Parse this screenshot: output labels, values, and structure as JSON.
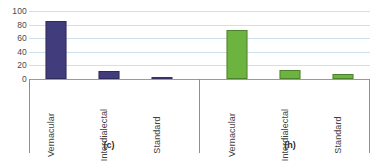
{
  "chart_data": {
    "type": "bar",
    "title": "",
    "subtitle": "",
    "xlabel": "",
    "ylabel": "",
    "ylim": [
      0,
      100
    ],
    "yticks": [
      0,
      20,
      40,
      60,
      80,
      100
    ],
    "ytick_labels": [
      "0",
      "20",
      "40",
      "60",
      "80",
      "100"
    ],
    "grid": true,
    "legend": "none",
    "categories": [
      "Vernacular",
      "Interdialectal",
      "Standard"
    ],
    "panels": [
      {
        "caption": "(c)",
        "color": "#413C7C",
        "categories": [
          "Vernacular",
          "Interdialectal",
          "Standard"
        ],
        "values": [
          86,
          12,
          0.5
        ]
      },
      {
        "caption": "(h)",
        "color": "#6CB33F",
        "categories": [
          "Vernacular",
          "Interdialectal",
          "Standard"
        ],
        "values": [
          73,
          13,
          7
        ]
      }
    ],
    "colors": {
      "panel_c_bar": "#413C7C",
      "panel_h_bar": "#6CB33F",
      "gridline": "#CFE0EF",
      "axis": "#8E8E8E",
      "text": "#3F3F3F",
      "background": "#FFFFFF"
    }
  }
}
